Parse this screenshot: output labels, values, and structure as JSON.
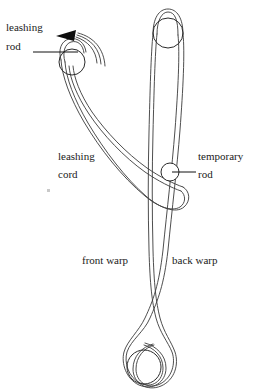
{
  "figure": {
    "background_color": "#ffffff",
    "line_color": "#3a3a3a",
    "text_color": "#1a1a1a",
    "width": 254,
    "height": 391
  },
  "labels": {
    "leashing_rod_line1": "leashing",
    "leashing_rod_line2": "rod",
    "leashing_cord_line1": "leashing",
    "leashing_cord_line2": "cord",
    "temporary_rod_line1": "temporary",
    "temporary_rod_line2": "rod",
    "front_warp": "front warp",
    "back_warp": "back warp"
  },
  "icons": {
    "arrow": "arrow-left-icon",
    "leashing_rod_marker": "circle-rod-icon",
    "temporary_rod_marker": "circle-rod-icon",
    "warp_top_rod_marker": "circle-rod-icon",
    "warp_bottom_rod_marker": "circle-rod-icon"
  },
  "elements": {
    "leashing_rod_circle": {
      "cx": 72,
      "cy": 62,
      "r": 13
    },
    "temporary_rod_circle": {
      "cx": 170,
      "cy": 172,
      "r": 9
    },
    "warp_top_circle": {
      "cx": 168,
      "cy": 33,
      "r": 15
    },
    "warp_bottom_circle": {
      "cx": 144,
      "cy": 367,
      "r": 17
    }
  }
}
